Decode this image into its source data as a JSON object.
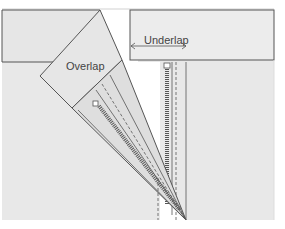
{
  "diagram": {
    "labels": {
      "overlap": "Overlap",
      "underlap": "Underlap"
    },
    "colors": {
      "fabric": "#e6e6e6",
      "fabric_fold": "#dcdcdc",
      "outline": "#555555",
      "background": "#ffffff"
    }
  }
}
